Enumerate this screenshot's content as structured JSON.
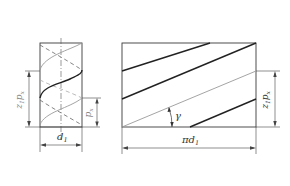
{
  "diagram": {
    "colors": {
      "outline": "#3a3a3a",
      "thread_dark": "#222222",
      "thread_light": "#9a9a9a",
      "dim_line": "#444444",
      "label": "#333333",
      "label_gray": "#888888",
      "background": "#ffffff"
    },
    "cylinder_view": {
      "label_diameter": "d",
      "label_diameter_sub": "1",
      "label_lead": "z",
      "label_lead_sub": "1",
      "label_lead_rest": "p",
      "label_lead_rest_sub": "x",
      "label_pitch": "p",
      "label_pitch_sub": "x"
    },
    "development_view": {
      "label_angle": "γ",
      "label_circumference": "πd",
      "label_circumference_sub": "1",
      "label_lead": "z",
      "label_lead_sub": "1",
      "label_lead_rest": "p",
      "label_lead_rest_sub": "x"
    }
  }
}
